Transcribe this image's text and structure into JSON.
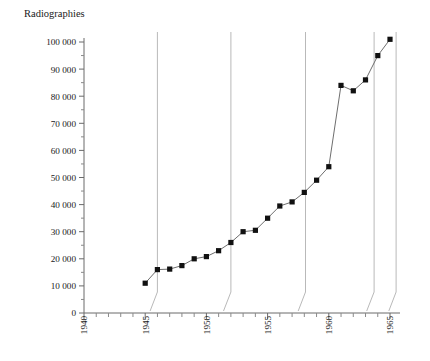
{
  "chart_data": {
    "type": "line",
    "title": "Radiographies",
    "xlabel": "",
    "ylabel": "",
    "xlim": [
      1940,
      1965.8
    ],
    "ylim": [
      0,
      104000
    ],
    "grid": false,
    "legend_position": "none",
    "y_ticks": [
      0,
      10000,
      20000,
      30000,
      40000,
      50000,
      60000,
      70000,
      80000,
      90000,
      100000
    ],
    "y_tick_labels": [
      "0",
      "10 000",
      "20 000",
      "30 000",
      "40 000",
      "50 000",
      "60 000",
      "70 000",
      "80 000",
      "90 000",
      "100 000"
    ],
    "y_minor_step": 5000,
    "x_ticks": [
      1940,
      1945,
      1950,
      1955,
      1960,
      1965
    ],
    "x_tick_labels": [
      "1940",
      "1945",
      "1950",
      "1955",
      "1960",
      "1965"
    ],
    "x_minor_step": 1,
    "marker": "square",
    "series": [
      {
        "name": "Radiographies",
        "x": [
          1945,
          1946,
          1947,
          1948,
          1949,
          1950,
          1951,
          1952,
          1953,
          1954,
          1955,
          1956,
          1957,
          1958,
          1959,
          1960,
          1961,
          1962,
          1963,
          1964,
          1965
        ],
        "values": [
          11000,
          16000,
          16200,
          17500,
          20000,
          20800,
          23000,
          26000,
          30000,
          30500,
          35000,
          39500,
          41000,
          44500,
          49000,
          54000,
          84000,
          82000,
          86000,
          95000,
          101000
        ]
      }
    ],
    "separators": [
      {
        "top_year": 1946.0,
        "base_year": 1945.4
      },
      {
        "top_year": 1952.0,
        "base_year": 1951.4
      },
      {
        "top_year": 1958.1,
        "base_year": 1957.5
      },
      {
        "top_year": 1963.7,
        "base_year": 1963.1
      },
      {
        "top_year": 1965.5,
        "base_year": 1964.9
      }
    ]
  }
}
